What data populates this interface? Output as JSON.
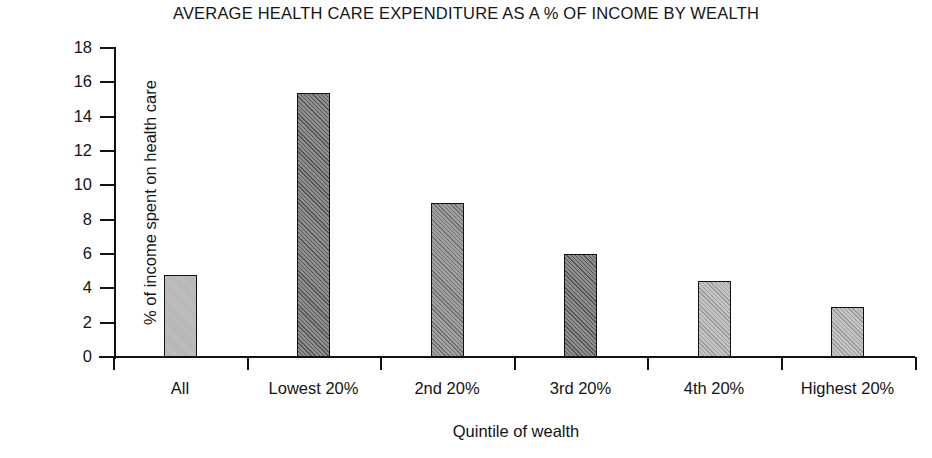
{
  "chart_data": {
    "type": "bar",
    "title": "AVERAGE HEALTH CARE EXPENDITURE AS A % OF INCOME BY WEALTH",
    "xlabel": "Quintile of wealth",
    "ylabel": "% of income spent on health care",
    "categories": [
      "All",
      "Lowest 20%",
      "2nd 20%",
      "3rd 20%",
      "4th 20%",
      "Highest 20%"
    ],
    "values": [
      4.8,
      15.4,
      9.0,
      6.0,
      4.4,
      2.9
    ],
    "ylim": [
      0,
      18
    ],
    "ytick_labels": [
      "0",
      "2",
      "4",
      "6",
      "8",
      "10",
      "12",
      "14",
      "16",
      "18"
    ],
    "ytick_values": [
      0,
      2,
      4,
      6,
      8,
      10,
      12,
      14,
      16,
      18
    ],
    "grid": false,
    "legend": null,
    "bar_styles": [
      "solid-light",
      "hatch-dark",
      "hatch-mid",
      "hatch-dark",
      "hatch-light",
      "hatch-light"
    ],
    "colors": {
      "axis": "#111111",
      "text": "#141414",
      "background": "#ffffff",
      "bar_light": "#c4c4c4",
      "bar_dark": "#8e8e8e"
    }
  }
}
